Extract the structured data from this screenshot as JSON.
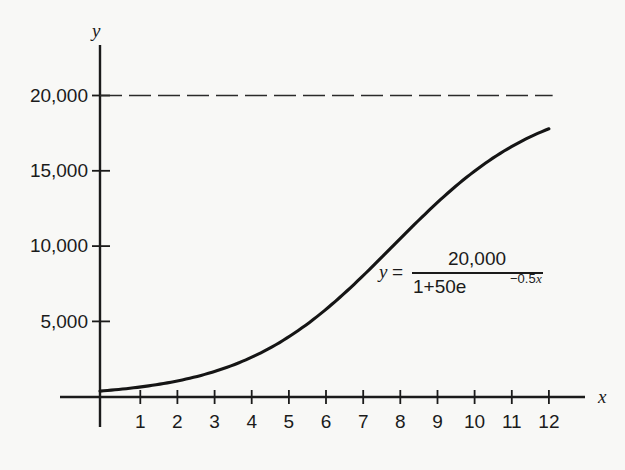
{
  "figure": {
    "background_color": "#f8f8f6",
    "ink_color": "#1b1b1b"
  },
  "annotation": {
    "equation_plain": "y = 20,000 / (1 + 50e^(-0.5x))",
    "lhs_var": "y",
    "equals": "=",
    "numerator": "20,000",
    "denominator_prefix": "1+50e",
    "exponent_number": "−0.5",
    "exponent_var": "x"
  },
  "chart_data": {
    "type": "line",
    "title": "",
    "subtitle": "",
    "xlabel": "x",
    "ylabel": "y",
    "xlim": [
      -1.1,
      13.05
    ],
    "ylim": [
      -1400,
      23900
    ],
    "grid": false,
    "legend": null,
    "x_ticks": [
      1,
      2,
      3,
      4,
      5,
      6,
      7,
      8,
      9,
      10,
      11,
      12
    ],
    "x_tick_labels": [
      "1",
      "2",
      "3",
      "4",
      "5",
      "6",
      "7",
      "8",
      "9",
      "10",
      "11",
      "12"
    ],
    "y_ticks": [
      5000,
      10000,
      15000,
      20000
    ],
    "y_tick_labels": [
      "5,000",
      "10,000",
      "15,000",
      "20,000"
    ],
    "annotations": [
      {
        "text": "y = 20,000/(1+50e^-0.5x)",
        "x": 8.6,
        "y": 7300
      }
    ],
    "series": [
      {
        "name": "logistic curve",
        "style": "solid",
        "formula": "y = 20000/(1+50*exp(-0.5*x))",
        "x": [
          0,
          0.5,
          1,
          1.5,
          2,
          2.5,
          3,
          3.5,
          4,
          4.5,
          5,
          5.5,
          6,
          6.5,
          7,
          7.5,
          8,
          8.5,
          9,
          9.5,
          10,
          10.5,
          11,
          11.5,
          12
        ],
        "values": [
          392,
          501,
          639,
          815,
          1037,
          1316,
          1665,
          2099,
          2634,
          3290,
          4085,
          5036,
          6157,
          7450,
          8906,
          10495,
          12164,
          13840,
          15439,
          16886,
          18127,
          19140,
          19933,
          20533,
          20976
        ]
      },
      {
        "name": "horizontal asymptote",
        "style": "dashed",
        "formula": "y = 20000",
        "x": [
          0,
          12.1
        ],
        "values": [
          20000,
          20000
        ]
      }
    ]
  }
}
